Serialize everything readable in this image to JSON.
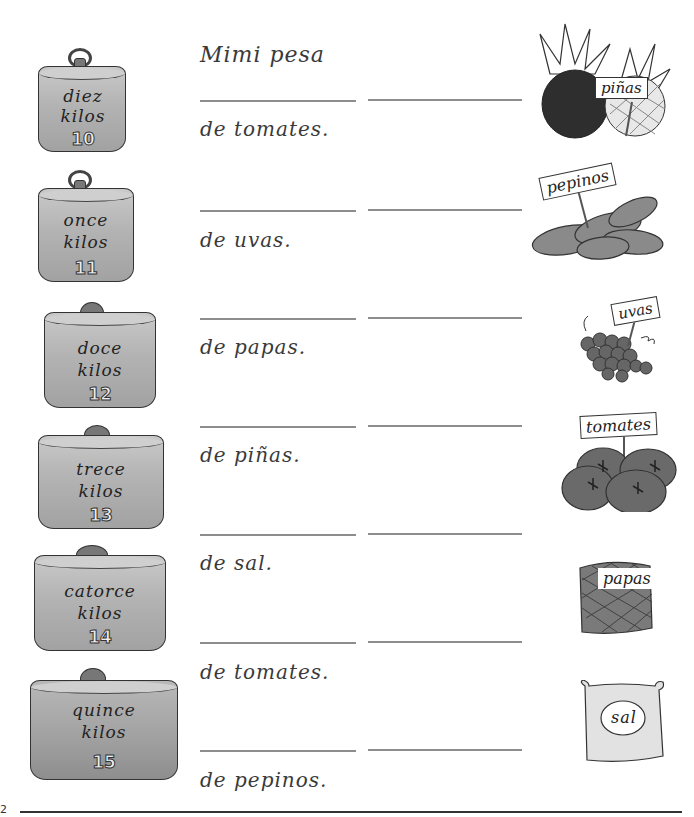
{
  "intro": "Mimi pesa",
  "prompts": [
    "de tomates.",
    "de uvas.",
    "de papas.",
    "de piñas.",
    "de sal.",
    "de tomates.",
    "de pepinos."
  ],
  "weights": [
    {
      "word": "diez",
      "unit": "kilos",
      "number": "10"
    },
    {
      "word": "once",
      "unit": "kilos",
      "number": "11"
    },
    {
      "word": "doce",
      "unit": "kilos",
      "number": "12"
    },
    {
      "word": "trece",
      "unit": "kilos",
      "number": "13"
    },
    {
      "word": "catorce",
      "unit": "kilos",
      "number": "14"
    },
    {
      "word": "quince",
      "unit": "kilos",
      "number": "15"
    }
  ],
  "items": [
    {
      "label": "piñas",
      "icon": "pineapple-icon"
    },
    {
      "label": "pepinos",
      "icon": "cucumber-icon"
    },
    {
      "label": "uvas",
      "icon": "grapes-icon"
    },
    {
      "label": "tomates",
      "icon": "tomato-icon"
    },
    {
      "label": "papas",
      "icon": "potato-sack-icon"
    },
    {
      "label": "sal",
      "icon": "salt-bag-icon"
    }
  ],
  "page_number": "2"
}
